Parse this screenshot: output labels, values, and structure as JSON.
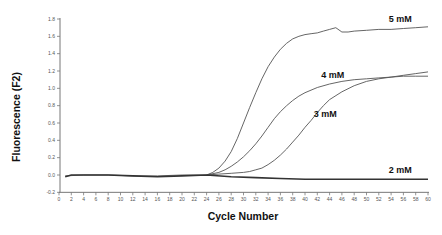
{
  "chart_data": {
    "type": "line",
    "title": "",
    "xlabel": "Cycle Number",
    "ylabel": "Fluorescence (F2)",
    "xlim": [
      0,
      60
    ],
    "ylim": [
      -0.2,
      1.8
    ],
    "xticks": [
      0,
      2,
      4,
      6,
      8,
      10,
      12,
      14,
      16,
      18,
      20,
      22,
      24,
      26,
      28,
      30,
      32,
      34,
      36,
      38,
      40,
      42,
      44,
      46,
      48,
      50,
      52,
      54,
      56,
      58,
      60
    ],
    "yticks": [
      -0.2,
      0.0,
      0.2,
      0.4,
      0.6,
      0.8,
      1.0,
      1.2,
      1.4,
      1.6,
      1.8
    ],
    "grid": false,
    "legend": "inline labels",
    "series": [
      {
        "name": "5 mM",
        "x": [
          1,
          4,
          8,
          12,
          16,
          20,
          24,
          25,
          26,
          27,
          28,
          29,
          30,
          31,
          32,
          33,
          34,
          35,
          36,
          37,
          38,
          39,
          40,
          41,
          42,
          43,
          44,
          45,
          46,
          47,
          48,
          50,
          52,
          54,
          56,
          58,
          60
        ],
        "y": [
          -0.01,
          0.0,
          0.0,
          -0.01,
          -0.01,
          0.0,
          0.0,
          0.03,
          0.08,
          0.16,
          0.27,
          0.42,
          0.6,
          0.78,
          0.95,
          1.11,
          1.25,
          1.36,
          1.45,
          1.52,
          1.57,
          1.6,
          1.62,
          1.63,
          1.64,
          1.66,
          1.68,
          1.7,
          1.65,
          1.65,
          1.66,
          1.67,
          1.68,
          1.68,
          1.69,
          1.7,
          1.71
        ]
      },
      {
        "name": "4 mM",
        "x": [
          24,
          26,
          27,
          28,
          29,
          30,
          31,
          32,
          33,
          34,
          35,
          36,
          37,
          38,
          39,
          40,
          42,
          44,
          46,
          48,
          50,
          52,
          54,
          56,
          58,
          60
        ],
        "y": [
          0.0,
          0.03,
          0.06,
          0.1,
          0.15,
          0.21,
          0.28,
          0.36,
          0.45,
          0.55,
          0.65,
          0.73,
          0.8,
          0.86,
          0.91,
          0.95,
          1.01,
          1.05,
          1.08,
          1.1,
          1.11,
          1.12,
          1.13,
          1.14,
          1.14,
          1.14
        ]
      },
      {
        "name": "3 mM",
        "x": [
          24,
          26,
          28,
          30,
          31,
          32,
          33,
          34,
          35,
          36,
          37,
          38,
          39,
          40,
          41,
          42,
          43,
          44,
          46,
          48,
          50,
          52,
          54,
          56,
          58,
          60
        ],
        "y": [
          0.0,
          0.01,
          0.02,
          0.03,
          0.04,
          0.06,
          0.08,
          0.12,
          0.17,
          0.23,
          0.3,
          0.38,
          0.46,
          0.55,
          0.63,
          0.72,
          0.8,
          0.87,
          0.96,
          1.03,
          1.08,
          1.11,
          1.13,
          1.15,
          1.17,
          1.19
        ]
      },
      {
        "name": "2 mM",
        "x": [
          1,
          2,
          4,
          8,
          12,
          16,
          20,
          24,
          28,
          32,
          36,
          40,
          44,
          48,
          52,
          56,
          60
        ],
        "y": [
          -0.02,
          0.0,
          0.0,
          0.0,
          -0.01,
          -0.02,
          -0.01,
          0.0,
          -0.02,
          -0.03,
          -0.04,
          -0.05,
          -0.05,
          -0.05,
          -0.05,
          -0.05,
          -0.05
        ]
      }
    ],
    "annotations": [
      {
        "text": "5 mM",
        "x": 55.5,
        "y": 1.76
      },
      {
        "text": "4 mM",
        "x": 44.5,
        "y": 1.12
      },
      {
        "text": "3 mM",
        "x": 43.3,
        "y": 0.67
      },
      {
        "text": "2 mM",
        "x": 55.5,
        "y": 0.02
      }
    ]
  }
}
